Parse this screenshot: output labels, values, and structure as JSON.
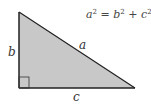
{
  "diagram": {
    "title_equation": {
      "a": "a",
      "b": "b",
      "c": "c",
      "sup": "2",
      "equals": " = ",
      "plus": " + "
    },
    "labels": {
      "hypotenuse": "a",
      "vertical_leg": "b",
      "horizontal_leg": "c"
    },
    "colors": {
      "fill": "#c8c8c8",
      "stroke": "#222222",
      "text": "#333333"
    }
  }
}
